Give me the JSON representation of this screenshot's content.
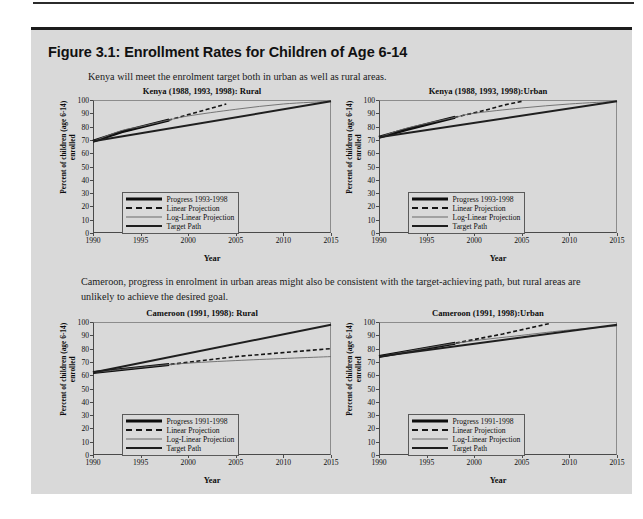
{
  "figure": {
    "heading": "Figure 3.1: Enrollment Rates for Children of Age 6-14",
    "paragraph_kenya": "Kenya will meet the enrolment target both in urban as well as rural areas.",
    "paragraph_cameroon": "Cameroon, progress in enrolment in urban areas might also be consistent  with the target-achieving path,  but rural areas are unlikely to achieve the desired goal."
  },
  "common": {
    "ylabel_line1": "Percent of children (age 6-14)",
    "ylabel_line2": "enrolled",
    "xlabel": "Year",
    "yticks": [
      "0",
      "10",
      "20",
      "30",
      "40",
      "50",
      "60",
      "70",
      "80",
      "90",
      "100"
    ],
    "xticks": [
      "1990",
      "1995",
      "2000",
      "2005",
      "2010",
      "2015"
    ],
    "ylim": [
      0,
      100
    ],
    "xlim": [
      1990,
      2015
    ],
    "colors": {
      "panel_background": "#d9d9d9",
      "page_background": "#ffffff",
      "rule": "#1c1c1c",
      "axis": "#4a4a4a",
      "progress": "#0d0d0d",
      "linear_projection": "#151515",
      "log_linear_projection": "#6a6a6a",
      "target_path": "#1f1f1f"
    }
  },
  "chart_data": [
    {
      "id": "kenya-rural",
      "type": "line",
      "title": "Kenya (1988, 1993, 1998): Rural",
      "xlabel": "Year",
      "ylabel": "Percent of children (age 6-14) enrolled",
      "xlim": [
        1990,
        2015
      ],
      "ylim": [
        0,
        100
      ],
      "grid": false,
      "legend_position": "lower-left",
      "series": [
        {
          "name": "Progress 1993-1998",
          "x": [
            1990,
            1993,
            1998
          ],
          "y": [
            69,
            76,
            85
          ]
        },
        {
          "name": "Linear Projection",
          "x": [
            1990,
            1993,
            1998,
            2000,
            2002,
            2004
          ],
          "y": [
            69,
            76,
            85,
            89,
            93,
            97
          ]
        },
        {
          "name": "Log-Linear Projection",
          "x": [
            1990,
            1993,
            1995,
            1998,
            2000,
            2005,
            2010,
            2015
          ],
          "y": [
            69,
            77,
            80,
            85,
            88,
            93,
            97,
            99
          ]
        },
        {
          "name": "Target Path",
          "x": [
            1990,
            2015
          ],
          "y": [
            69,
            99
          ]
        }
      ]
    },
    {
      "id": "kenya-urban",
      "type": "line",
      "title": "Kenya (1988, 1993, 1998):Urban",
      "xlabel": "Year",
      "ylabel": "Percent of children (age 6-14) enrolled",
      "xlim": [
        1990,
        2015
      ],
      "ylim": [
        0,
        100
      ],
      "grid": false,
      "legend_position": "lower-left",
      "series": [
        {
          "name": "Progress 1993-1998",
          "x": [
            1990,
            1993,
            1998
          ],
          "y": [
            72,
            78,
            87
          ]
        },
        {
          "name": "Linear Projection",
          "x": [
            1990,
            1993,
            1998,
            2001,
            2003,
            2005
          ],
          "y": [
            72,
            78,
            87,
            92,
            96,
            99
          ]
        },
        {
          "name": "Log-Linear Projection",
          "x": [
            1990,
            1993,
            1998,
            2000,
            2005,
            2010,
            2015
          ],
          "y": [
            72,
            79,
            87,
            90,
            94,
            97,
            99
          ]
        },
        {
          "name": "Target Path",
          "x": [
            1990,
            2015
          ],
          "y": [
            72,
            99
          ]
        }
      ]
    },
    {
      "id": "cameroon-rural",
      "type": "line",
      "title": "Cameroon (1991, 1998): Rural",
      "xlabel": "Year",
      "ylabel": "Percent of children (age 6-14) enrolled",
      "xlim": [
        1990,
        2015
      ],
      "ylim": [
        0,
        100
      ],
      "grid": false,
      "legend_position": "lower-left",
      "series": [
        {
          "name": "Progress 1991-1998",
          "x": [
            1990,
            1998
          ],
          "y": [
            62,
            68
          ]
        },
        {
          "name": "Linear Projection",
          "x": [
            1990,
            1998,
            2005,
            2015
          ],
          "y": [
            62,
            68,
            74,
            80
          ]
        },
        {
          "name": "Log-Linear Projection",
          "x": [
            1990,
            1998,
            2005,
            2015
          ],
          "y": [
            62,
            68,
            71,
            74
          ]
        },
        {
          "name": "Target Path",
          "x": [
            1990,
            2015
          ],
          "y": [
            62,
            98
          ]
        }
      ]
    },
    {
      "id": "cameroon-urban",
      "type": "line",
      "title": "Cameroon (1991, 1998):Urban",
      "xlabel": "Year",
      "ylabel": "Percent of children (age 6-14) enrolled",
      "xlim": [
        1990,
        2015
      ],
      "ylim": [
        0,
        100
      ],
      "grid": false,
      "legend_position": "lower-left",
      "series": [
        {
          "name": "Progress 1991-1998",
          "x": [
            1990,
            1998
          ],
          "y": [
            74,
            84
          ]
        },
        {
          "name": "Linear Projection",
          "x": [
            1990,
            1998,
            2003,
            2008
          ],
          "y": [
            74,
            84,
            91,
            99
          ]
        },
        {
          "name": "Log-Linear Projection",
          "x": [
            1990,
            1998,
            2005,
            2010,
            2015
          ],
          "y": [
            74,
            84,
            90,
            94,
            97
          ]
        },
        {
          "name": "Target Path",
          "x": [
            1990,
            2015
          ],
          "y": [
            74,
            98
          ]
        }
      ]
    }
  ],
  "legend_labels": {
    "progress_kenya": "Progress 1993-1998",
    "progress_cameroon": "Progress 1991-1998",
    "linear": "Linear Projection",
    "loglinear": "Log-Linear Projection",
    "target": "Target Path"
  }
}
